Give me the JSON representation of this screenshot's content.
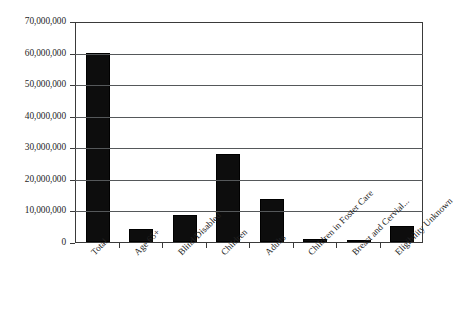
{
  "chart_data": {
    "type": "bar",
    "title": "",
    "subtitle": "",
    "xlabel": "",
    "ylabel": "",
    "ylim": [
      0,
      70000000
    ],
    "grid": true,
    "legend": false,
    "orientation": "vertical",
    "bar_color": "#0d0d0d",
    "categories": [
      "Total",
      "Age 65+",
      "Blind/Disabled",
      "Children",
      "Adults",
      "Children in Foster Care",
      "Breast and Cervial...",
      "Eligibility Unknown"
    ],
    "values": [
      60000000,
      4000000,
      8500000,
      28000000,
      13500000,
      900000,
      200000,
      5000000
    ],
    "ytick_values": [
      0,
      10000000,
      20000000,
      30000000,
      40000000,
      50000000,
      60000000,
      70000000
    ],
    "ytick_labels": [
      "0",
      "10,000,000",
      "20,000,000",
      "30,000,000",
      "40,000,000",
      "50,000,000",
      "60,000,000",
      "70,000,000"
    ]
  }
}
